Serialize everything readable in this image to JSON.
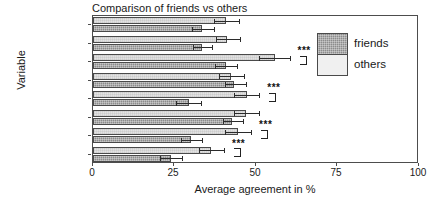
{
  "chart_data": {
    "type": "bar",
    "orientation": "horizontal",
    "title": "Comparison of friends vs others",
    "xlabel": "Average agreement in %",
    "ylabel": "Variable",
    "xlim": [
      0,
      100
    ],
    "xticks": [
      0,
      25,
      50,
      75,
      100
    ],
    "xticklabels": [
      "0",
      "25",
      "50",
      "75",
      "100"
    ],
    "grid": false,
    "legend_position": "right",
    "categories": [
      "afd",
      "afd2",
      "demosoc",
      "immigration",
      "immigration2",
      "leftdisconnect",
      "russia",
      "womensrights"
    ],
    "categories_top_to_bottom": [
      "womensrights",
      "russia",
      "leftdisconnect",
      "immigration2",
      "immigration",
      "demosoc",
      "afd2",
      "afd"
    ],
    "series": [
      {
        "name": "friends",
        "values_top_to_bottom": [
          33.4,
          33.4,
          40.8,
          43.3,
          29.4,
          42.6,
          30.0,
          23.9
        ],
        "errors_low_top_to_bottom": [
          30.5,
          30.8,
          37.5,
          40.5,
          25.5,
          39.8,
          26.9,
          20.6
        ],
        "errors_high_top_to_bottom": [
          37.0,
          36.6,
          44.2,
          46.8,
          33.2,
          46.0,
          33.4,
          27.4
        ]
      },
      {
        "name": "others",
        "values_top_to_bottom": [
          40.8,
          41.1,
          55.8,
          42.3,
          47.2,
          47.0,
          44.5,
          36.2
        ],
        "errors_low_top_to_bottom": [
          37.0,
          37.8,
          51.0,
          38.5,
          43.2,
          43.3,
          40.5,
          32.4
        ],
        "errors_high_top_to_bottom": [
          44.7,
          45.0,
          60.3,
          46.2,
          51.0,
          51.0,
          48.5,
          40.2
        ]
      }
    ],
    "annotations": [
      {
        "label": "***",
        "category": "leftdisconnect"
      },
      {
        "label": "***",
        "category": "immigration"
      },
      {
        "label": "***",
        "category": "afd2"
      },
      {
        "label": "***",
        "category": "afd"
      }
    ]
  },
  "legend": {
    "friends_label": "friends",
    "others_label": "others"
  },
  "axis": {
    "x_tick_0": "0",
    "x_tick_25": "25",
    "x_tick_50": "50",
    "x_tick_75": "75",
    "x_tick_100": "100"
  },
  "ylabels": {
    "r0": "womensrights",
    "r1": "russia",
    "r2": "leftdisconnect",
    "r3": "immigration2",
    "r4": "immigration",
    "r5": "demosoc",
    "r6": "afd2",
    "r7": "afd"
  },
  "sig": {
    "s0": "***",
    "s1": "***",
    "s2": "***",
    "s3": "***"
  }
}
